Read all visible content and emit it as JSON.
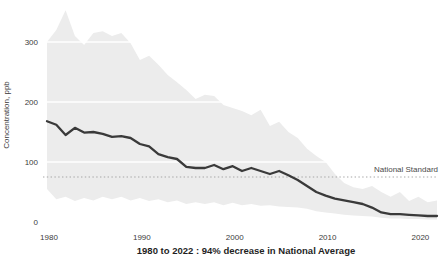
{
  "figure": {
    "background": "#ffffff"
  },
  "chart_data": {
    "type": "area",
    "title": "1980 to 2022 : 94% decrease in National Average",
    "xlabel": "",
    "ylabel": "Concentration, ppb",
    "xlim": [
      1980,
      2022
    ],
    "ylim": [
      0,
      355
    ],
    "x_ticks": [
      "1980",
      "1990",
      "2000",
      "2010",
      "2020"
    ],
    "x_tick_years": [
      1980,
      1990,
      2000,
      2010,
      2020
    ],
    "y_ticks": [
      "0",
      "100",
      "200",
      "300"
    ],
    "y_tick_values": [
      0,
      100,
      200,
      300
    ],
    "grid": "white horizontal gridlines visible over shaded band",
    "legend_position": "none",
    "reference_line": {
      "label": "National Standard",
      "value": 75,
      "style": "dotted"
    },
    "x": [
      1980,
      1981,
      1982,
      1983,
      1984,
      1985,
      1986,
      1987,
      1988,
      1989,
      1990,
      1991,
      1992,
      1993,
      1994,
      1995,
      1996,
      1997,
      1998,
      1999,
      2000,
      2001,
      2002,
      2003,
      2004,
      2005,
      2006,
      2007,
      2008,
      2009,
      2010,
      2011,
      2012,
      2013,
      2014,
      2015,
      2016,
      2017,
      2018,
      2019,
      2020,
      2021,
      2022
    ],
    "series": [
      {
        "name": "National Average",
        "role": "mean-line",
        "values": [
          168,
          162,
          145,
          157,
          149,
          150,
          147,
          142,
          143,
          140,
          130,
          126,
          113,
          108,
          105,
          92,
          90,
          90,
          95,
          88,
          93,
          85,
          90,
          85,
          80,
          85,
          78,
          70,
          60,
          50,
          44,
          39,
          36,
          33,
          30,
          24,
          16,
          13,
          13,
          12,
          11,
          10,
          10
        ]
      },
      {
        "name": "Range upper bound",
        "role": "band-upper",
        "values": [
          300,
          320,
          353,
          310,
          295,
          315,
          318,
          310,
          315,
          298,
          270,
          277,
          262,
          245,
          233,
          220,
          205,
          212,
          210,
          195,
          190,
          185,
          178,
          187,
          160,
          167,
          150,
          140,
          122,
          110,
          100,
          80,
          65,
          58,
          55,
          60,
          50,
          42,
          50,
          35,
          42,
          33,
          36
        ]
      },
      {
        "name": "Range lower bound",
        "role": "band-lower",
        "values": [
          55,
          38,
          42,
          35,
          40,
          36,
          42,
          38,
          42,
          36,
          40,
          35,
          38,
          33,
          36,
          30,
          33,
          30,
          33,
          28,
          32,
          28,
          30,
          27,
          28,
          26,
          25,
          24,
          22,
          18,
          16,
          14,
          12,
          11,
          10,
          9,
          7,
          6,
          6,
          5,
          5,
          4,
          4
        ]
      }
    ],
    "colors": {
      "band": "#ececec",
      "mean_line": "#3a3a3a",
      "standard_line": "#a5a5a5",
      "tick_text": "#3c3c3c",
      "standard_text": "#4a4a4a",
      "title_text": "#1f1f1f",
      "gridline": "#ffffff"
    }
  }
}
